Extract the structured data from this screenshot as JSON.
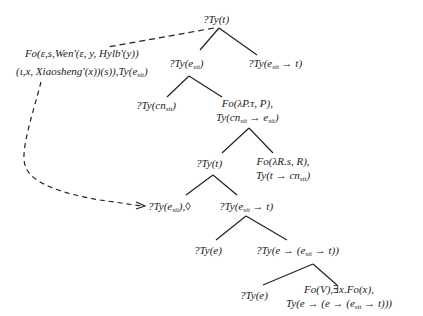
{
  "diagram": {
    "type": "semantic-tree",
    "nodes": {
      "root": {
        "lines": [
          "?Ty(t)"
        ]
      },
      "annotation": {
        "lines": [
          "Fo(ε,s,Wen'(ε, y, Hylb'(y))",
          "(ι,x, Xiaosheng'(x))(s)),Ty(e_sit)"
        ]
      },
      "n1": {
        "lines": [
          "?Ty(e_sit)"
        ]
      },
      "n2": {
        "lines": [
          "?Ty(e_sit → t)"
        ]
      },
      "n3": {
        "lines": [
          "?Ty(cn_sit)"
        ]
      },
      "n4": {
        "lines": [
          "Fo(λP.τ, P),",
          "Ty(cn_sit → e_sit)"
        ]
      },
      "n5": {
        "lines": [
          "?Ty(t)"
        ]
      },
      "n6": {
        "lines": [
          "Fo(λR.s, R),",
          "Ty(t → cn_sit)"
        ]
      },
      "n7": {
        "lines": [
          "?Ty(e_sit),◊"
        ]
      },
      "n8": {
        "lines": [
          "?Ty(e_sit → t)"
        ]
      },
      "n9": {
        "lines": [
          "?Ty(e)"
        ]
      },
      "n10": {
        "lines": [
          "?Ty(e → (e_sit → t))"
        ]
      },
      "n11": {
        "lines": [
          "?Ty(e)"
        ]
      },
      "n12": {
        "lines": [
          "Fo(V),∃x.Fo(x),",
          "Ty(e → (e → (e_sit → t)))"
        ]
      }
    },
    "edges": [
      [
        "root",
        "n1"
      ],
      [
        "root",
        "n2"
      ],
      [
        "n1",
        "n3"
      ],
      [
        "n1",
        "n4"
      ],
      [
        "n4",
        "n5"
      ],
      [
        "n4",
        "n6"
      ],
      [
        "n5",
        "n7"
      ],
      [
        "n5",
        "n8"
      ],
      [
        "n8",
        "n9"
      ],
      [
        "n8",
        "n10"
      ],
      [
        "n10",
        "n11"
      ],
      [
        "n10",
        "n12"
      ]
    ],
    "dashed_links": [
      {
        "from": "root",
        "to": "annotation",
        "style": "dashed"
      },
      {
        "from": "annotation",
        "to": "n7",
        "style": "dashed-arrow"
      }
    ],
    "line_color": "#222222"
  }
}
